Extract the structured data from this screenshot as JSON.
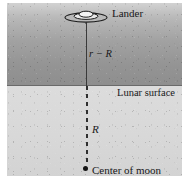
{
  "figure": {
    "type": "physics-diagram",
    "labels": {
      "lander": "Lander",
      "altitude": "r − R",
      "surface": "Lunar surface",
      "radius": "R",
      "center": "Center of moon"
    },
    "icons": {
      "lander": "lunar-lander-saucer-icon",
      "center_marker": "center-of-moon-dot-icon"
    },
    "regions": {
      "space": {
        "name": "space-above-surface",
        "fill": "#9a9a9a"
      },
      "interior": {
        "name": "moon-interior",
        "fill": "#d8d8d8"
      }
    },
    "lines": {
      "surface_boundary": {
        "style": "solid",
        "color": "#6a6a6a"
      },
      "altitude_segment": {
        "style": "solid",
        "color": "#3a3a3a"
      },
      "radius_segment": {
        "style": "dashed",
        "color": "#2f2f2f"
      }
    }
  }
}
